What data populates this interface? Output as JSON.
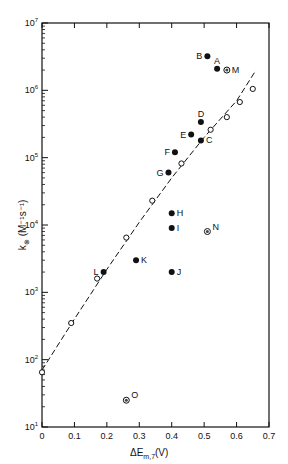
{
  "chart_data": {
    "type": "scatter",
    "title": "",
    "xlabel": "ΔE",
    "xlabel_sub": "m,7",
    "xlabel_unit": "(V)",
    "ylabel": "k",
    "ylabel_sub": "⊗",
    "ylabel_unit": "(M⁻¹s⁻¹)",
    "xlim": [
      0,
      0.7
    ],
    "ylim": [
      10,
      10000000
    ],
    "yscale": "log",
    "grid": false,
    "legend": null,
    "x_ticks": [
      "0",
      "0.1",
      "0.2",
      "0.3",
      "0.4",
      "0.5",
      "0.6",
      "0.7"
    ],
    "y_ticks": [
      {
        "base": "10",
        "exp": "1"
      },
      {
        "base": "10",
        "exp": "2"
      },
      {
        "base": "10",
        "exp": "3"
      },
      {
        "base": "10",
        "exp": "4"
      },
      {
        "base": "10",
        "exp": "5"
      },
      {
        "base": "10",
        "exp": "6"
      },
      {
        "base": "10",
        "exp": "7"
      }
    ],
    "series": [
      {
        "name": "open circles (fit)",
        "marker": "open-circle",
        "points": [
          {
            "x": 0.0,
            "y": 65
          },
          {
            "x": 0.09,
            "y": 350
          },
          {
            "x": 0.17,
            "y": 1600
          },
          {
            "x": 0.26,
            "y": 6500
          },
          {
            "x": 0.34,
            "y": 23000
          },
          {
            "x": 0.43,
            "y": 82000
          },
          {
            "x": 0.52,
            "y": 260000
          },
          {
            "x": 0.57,
            "y": 400000
          },
          {
            "x": 0.61,
            "y": 670000
          },
          {
            "x": 0.65,
            "y": 1050000
          }
        ]
      },
      {
        "name": "labeled filled points",
        "marker": "filled-circle",
        "points": [
          {
            "label": "A",
            "x": 0.54,
            "y": 2100000
          },
          {
            "label": "B",
            "x": 0.51,
            "y": 3200000
          },
          {
            "label": "C",
            "x": 0.49,
            "y": 180000
          },
          {
            "label": "D",
            "x": 0.49,
            "y": 340000
          },
          {
            "label": "E",
            "x": 0.46,
            "y": 220000
          },
          {
            "label": "F",
            "x": 0.41,
            "y": 120000
          },
          {
            "label": "G",
            "x": 0.39,
            "y": 60000
          },
          {
            "label": "H",
            "x": 0.4,
            "y": 15000
          },
          {
            "label": "I",
            "x": 0.4,
            "y": 9000
          },
          {
            "label": "J",
            "x": 0.4,
            "y": 2000
          },
          {
            "label": "K",
            "x": 0.29,
            "y": 3000
          },
          {
            "label": "L",
            "x": 0.19,
            "y": 2000
          }
        ]
      },
      {
        "name": "labeled crossed points",
        "marker": "circled-dot",
        "points": [
          {
            "label": "M",
            "x": 0.57,
            "y": 2000000
          },
          {
            "label": "N",
            "x": 0.51,
            "y": 8000
          },
          {
            "label": "O",
            "x": 0.26,
            "y": 25
          }
        ]
      }
    ],
    "fit_curve": {
      "style": "dashed",
      "points": [
        {
          "x": 0.0,
          "y": 70
        },
        {
          "x": 0.1,
          "y": 400
        },
        {
          "x": 0.2,
          "y": 2200
        },
        {
          "x": 0.3,
          "y": 11000
        },
        {
          "x": 0.4,
          "y": 50000
        },
        {
          "x": 0.5,
          "y": 200000
        },
        {
          "x": 0.6,
          "y": 700000
        },
        {
          "x": 0.66,
          "y": 2000000
        }
      ]
    }
  }
}
